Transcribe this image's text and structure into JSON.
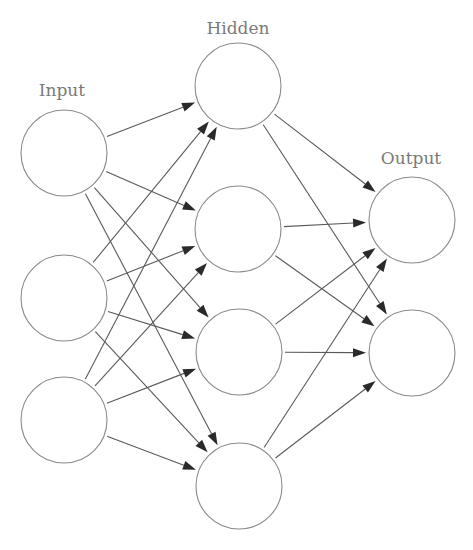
{
  "diagram": {
    "type": "feedforward-neural-network",
    "colors": {
      "background": "#ffffff",
      "node_stroke": "#8a8a8a",
      "edge_stroke": "#5a5a5a",
      "arrowhead": "#2a2a2a",
      "label": "#7a7a7a"
    },
    "node_radius": 43,
    "layers": [
      {
        "id": "input",
        "label": "Input",
        "label_pos": {
          "x": 62,
          "y": 96
        },
        "nodes": [
          {
            "id": "i1",
            "x": 64,
            "y": 153
          },
          {
            "id": "i2",
            "x": 64,
            "y": 298
          },
          {
            "id": "i3",
            "x": 64,
            "y": 420
          }
        ]
      },
      {
        "id": "hidden",
        "label": "Hidden",
        "label_pos": {
          "x": 238,
          "y": 34
        },
        "nodes": [
          {
            "id": "h1",
            "x": 238,
            "y": 86
          },
          {
            "id": "h2",
            "x": 238,
            "y": 229
          },
          {
            "id": "h3",
            "x": 239,
            "y": 352
          },
          {
            "id": "h4",
            "x": 239,
            "y": 486
          }
        ]
      },
      {
        "id": "output",
        "label": "Output",
        "label_pos": {
          "x": 411,
          "y": 164
        },
        "nodes": [
          {
            "id": "o1",
            "x": 412,
            "y": 220
          },
          {
            "id": "o2",
            "x": 412,
            "y": 353
          }
        ]
      }
    ],
    "connectivity": "fully-connected between adjacent layers",
    "edges": [
      [
        "i1",
        "h1"
      ],
      [
        "i1",
        "h2"
      ],
      [
        "i1",
        "h3"
      ],
      [
        "i1",
        "h4"
      ],
      [
        "i2",
        "h1"
      ],
      [
        "i2",
        "h2"
      ],
      [
        "i2",
        "h3"
      ],
      [
        "i2",
        "h4"
      ],
      [
        "i3",
        "h1"
      ],
      [
        "i3",
        "h2"
      ],
      [
        "i3",
        "h3"
      ],
      [
        "i3",
        "h4"
      ],
      [
        "h1",
        "o1"
      ],
      [
        "h1",
        "o2"
      ],
      [
        "h2",
        "o1"
      ],
      [
        "h2",
        "o2"
      ],
      [
        "h3",
        "o1"
      ],
      [
        "h3",
        "o2"
      ],
      [
        "h4",
        "o1"
      ],
      [
        "h4",
        "o2"
      ]
    ]
  }
}
